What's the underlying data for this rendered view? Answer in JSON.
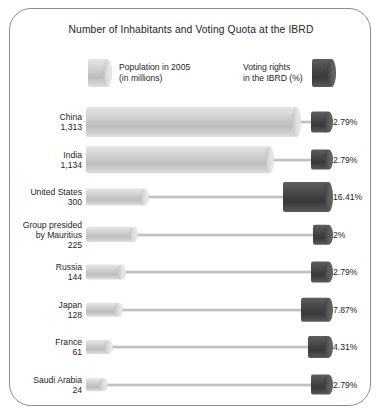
{
  "chart_data": {
    "type": "bar",
    "title": "Number of Inhabitants and Voting Quota at the IBRD",
    "xlabel": "",
    "ylabel": "",
    "grid": false,
    "legend_position": "top",
    "categories": [
      "China",
      "India",
      "United States",
      "Group presided by Mauritius",
      "Russia",
      "Japan",
      "France",
      "Saudi Arabia"
    ],
    "series": [
      {
        "name": "Population in 2005 (in millions)",
        "unit": "millions",
        "color": "#c8c8c8",
        "values": [
          1313,
          1134,
          300,
          225,
          144,
          128,
          61,
          24
        ]
      },
      {
        "name": "Voting rights in the IBRD (%)",
        "unit": "%",
        "color": "#494949",
        "values": [
          2.79,
          2.79,
          16.41,
          2,
          2.79,
          7.87,
          4.31,
          2.79
        ]
      }
    ]
  },
  "frame": {
    "border_color": "#8c8c93",
    "background": "#ffffff"
  },
  "title": "Number of Inhabitants and Voting Quota at the IBRD",
  "legend": {
    "population": {
      "line1": "Population in 2005",
      "line2": "(in millions)",
      "swatch": "light-cylinder-icon"
    },
    "voting": {
      "line1": "Voting rights",
      "line2": "in the IBRD (%)",
      "swatch": "dark-cylinder-icon"
    }
  },
  "rows": [
    {
      "country": "China",
      "population": "1,313",
      "percent": "2.79%",
      "pop_value": 1313,
      "pct_value": 2.79
    },
    {
      "country": "India",
      "population": "1,134",
      "percent": "2.79%",
      "pop_value": 1134,
      "pct_value": 2.79
    },
    {
      "country": "United States",
      "population": "300",
      "percent": "16.41%",
      "pop_value": 300,
      "pct_value": 16.41
    },
    {
      "country": "Group presided by Mauritius",
      "country_line1": "Group presided",
      "country_line2": "by Mauritius",
      "population": "225",
      "percent": "2%",
      "pop_value": 225,
      "pct_value": 2
    },
    {
      "country": "Russia",
      "population": "144",
      "percent": "2.79%",
      "pop_value": 144,
      "pct_value": 2.79
    },
    {
      "country": "Japan",
      "population": "128",
      "percent": "7.87%",
      "pop_value": 128,
      "pct_value": 7.87
    },
    {
      "country": "France",
      "population": "61",
      "percent": "4.31%",
      "pop_value": 61,
      "pct_value": 4.31
    },
    {
      "country": "Saudi Arabia",
      "population": "24",
      "percent": "2.79%",
      "pop_value": 24,
      "pct_value": 2.79
    }
  ],
  "scale": {
    "pop_max_px": 211,
    "pop_min_px": 14,
    "vote_max_px": 46,
    "vote_min_px": 12,
    "track_px": 243
  }
}
